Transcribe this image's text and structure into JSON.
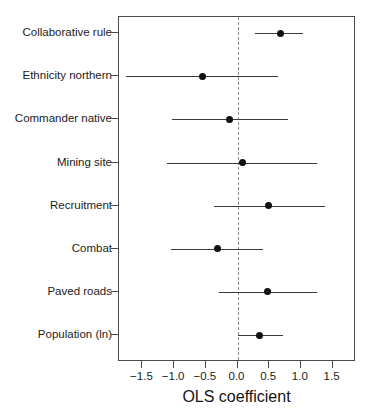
{
  "chart_data": {
    "type": "scatter",
    "title": "",
    "xlabel": "OLS coefficient",
    "ylabel": "",
    "xlim": [
      -1.87,
      1.87
    ],
    "xticks": [
      -1.5,
      -1.0,
      -0.5,
      0.0,
      0.5,
      1.0,
      1.5
    ],
    "xtick_labels": [
      "-1.5",
      "-1.0",
      "-0.5",
      "0.0",
      "0.5",
      "1.0",
      "1.5"
    ],
    "grid": false,
    "legend": "none",
    "reference_line": {
      "value": 0.0,
      "style": "dashed",
      "color": "#8d8d8d"
    },
    "point_color": "#111111",
    "line_color": "#3a3a3a",
    "frame_color": "#4a4a4a",
    "categories": [
      "Collaborative rule",
      "Ethnicity northern",
      "Commander native",
      "Mining site",
      "Recruitment",
      "Combat",
      "Paved roads",
      "Population (ln)"
    ],
    "estimates": [
      0.68,
      -0.55,
      -0.13,
      0.08,
      0.49,
      -0.32,
      0.48,
      0.35
    ],
    "ci_low": [
      0.27,
      -1.76,
      -1.03,
      -1.12,
      -0.37,
      -1.05,
      -0.29,
      0.01
    ],
    "ci_high": [
      1.04,
      0.64,
      0.8,
      1.25,
      1.38,
      0.4,
      1.25,
      0.72
    ],
    "points": [
      {
        "label": "Collaborative rule",
        "estimate": 0.68,
        "ci_low": 0.27,
        "ci_high": 1.04
      },
      {
        "label": "Ethnicity northern",
        "estimate": -0.55,
        "ci_low": -1.76,
        "ci_high": 0.64
      },
      {
        "label": "Commander native",
        "estimate": -0.13,
        "ci_low": -1.03,
        "ci_high": 0.8
      },
      {
        "label": "Mining site",
        "estimate": 0.08,
        "ci_low": -1.12,
        "ci_high": 1.25
      },
      {
        "label": "Recruitment",
        "estimate": 0.49,
        "ci_low": -0.37,
        "ci_high": 1.38
      },
      {
        "label": "Combat",
        "estimate": -0.32,
        "ci_low": -1.05,
        "ci_high": 0.4
      },
      {
        "label": "Paved roads",
        "estimate": 0.48,
        "ci_low": -0.29,
        "ci_high": 1.25
      },
      {
        "label": "Population (ln)",
        "estimate": 0.35,
        "ci_low": 0.01,
        "ci_high": 0.72
      }
    ]
  },
  "page_bleed": {
    "text": ""
  }
}
